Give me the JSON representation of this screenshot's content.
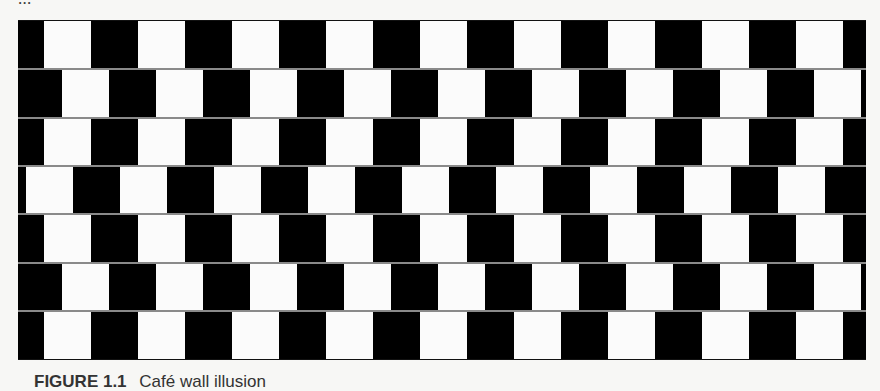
{
  "page": {
    "previous_text_fragment": "...",
    "background_color": "#f7f7f5"
  },
  "figure": {
    "name": "Café wall illusion",
    "tile_color_dark": "#000000",
    "tile_color_light": "#fbfbfb",
    "mortar_color": "#8a8a8a",
    "tile_width": 47,
    "row_height": 48,
    "rows": 7,
    "row_white_offsets": [
      26,
      44,
      26,
      8,
      26,
      44,
      26
    ]
  },
  "caption": {
    "label": "FIGURE 1.1",
    "text": "Café wall illusion"
  }
}
